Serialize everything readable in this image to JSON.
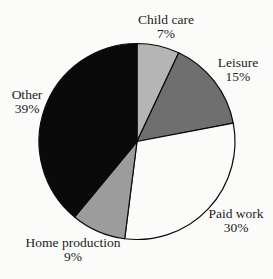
{
  "chart_data": {
    "type": "pie",
    "title": "",
    "categories": [
      "Child care",
      "Leisure",
      "Paid work",
      "Home production",
      "Other"
    ],
    "values": [
      7,
      15,
      30,
      9,
      39
    ],
    "unit": "%",
    "colors": [
      "#b5b5b5",
      "#6f6f6f",
      "#fbfbfa",
      "#9c9c9c",
      "#0a0a0a"
    ],
    "outline_color": "#0a0a0a",
    "start_angle_deg": 0,
    "direction": "clockwise",
    "legend_position": "none",
    "labels": [
      {
        "name": "Child care",
        "pct": "7%"
      },
      {
        "name": "Leisure",
        "pct": "15%"
      },
      {
        "name": "Paid work",
        "pct": "30%"
      },
      {
        "name": "Home production",
        "pct": "9%"
      },
      {
        "name": "Other",
        "pct": "39%"
      }
    ]
  }
}
